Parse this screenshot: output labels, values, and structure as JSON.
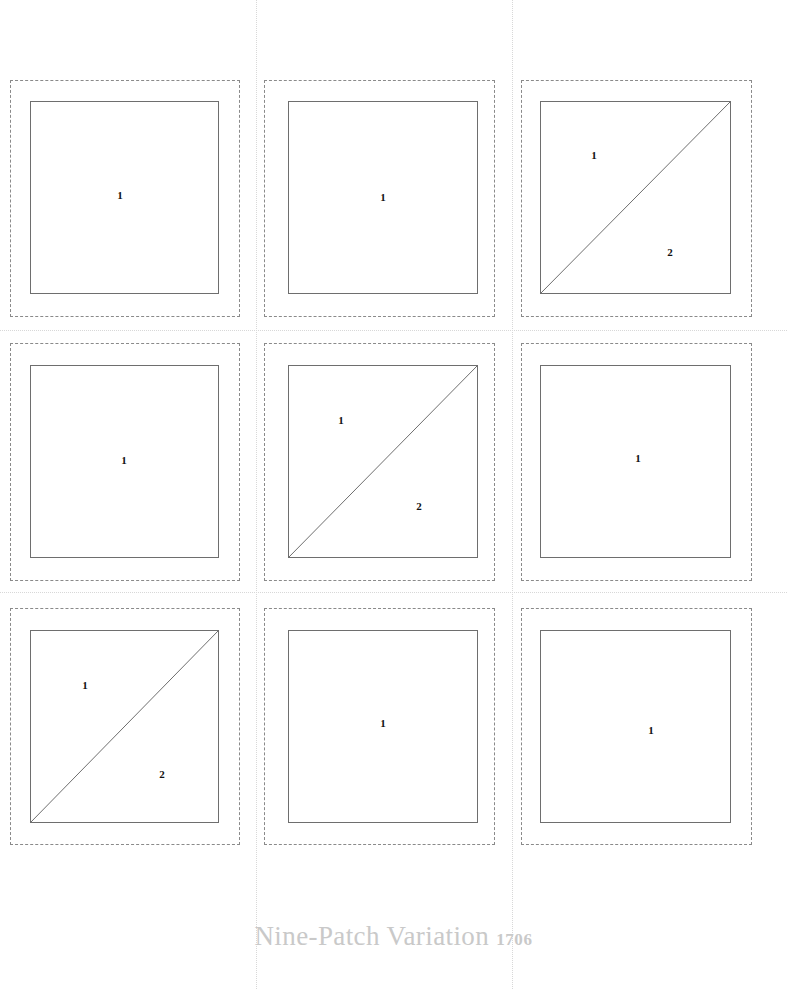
{
  "page": {
    "background_color": "#ffffff",
    "width": 787,
    "height": 989
  },
  "footer": {
    "title": "Nine-Patch Variation",
    "pattern_number": "1706",
    "color": "#c9c9c9"
  },
  "style": {
    "seam_line_color": "#8a8a8a",
    "cut_line_color": "#6e6e6e",
    "guide_line_color": "#d8d8d8",
    "label_color": "#111111"
  },
  "grid": {
    "rows": 3,
    "columns": 3,
    "total_blocks": 9
  },
  "guides": {
    "vertical": [
      {
        "x": 256,
        "y": 0,
        "height": 989
      },
      {
        "x": 512,
        "y": 0,
        "height": 989
      }
    ],
    "horizontal": [
      {
        "y": 330,
        "x": 0,
        "width": 787
      },
      {
        "y": 592,
        "x": 0,
        "width": 787
      }
    ]
  },
  "blocks": [
    {
      "id": "block-r1c1",
      "row": 1,
      "column": 1,
      "shape": "square",
      "seam": {
        "x": 10,
        "y": 80,
        "width": 230,
        "height": 237
      },
      "cut": {
        "x": 20,
        "y": 21,
        "width": 189,
        "height": 193
      },
      "labels": [
        {
          "text": "1",
          "x": 110,
          "y": 115
        }
      ]
    },
    {
      "id": "block-r1c2",
      "row": 1,
      "column": 2,
      "shape": "square",
      "seam": {
        "x": 264,
        "y": 80,
        "width": 231,
        "height": 237
      },
      "cut": {
        "x": 24,
        "y": 21,
        "width": 190,
        "height": 193
      },
      "labels": [
        {
          "text": "1",
          "x": 119,
          "y": 117
        }
      ]
    },
    {
      "id": "block-r1c3",
      "row": 1,
      "column": 3,
      "shape": "half-square-triangle",
      "diagonal_direction": "bottom-left-to-top-right",
      "seam": {
        "x": 521,
        "y": 80,
        "width": 231,
        "height": 237
      },
      "cut": {
        "x": 19,
        "y": 21,
        "width": 191,
        "height": 193
      },
      "labels": [
        {
          "text": "1",
          "x": 73,
          "y": 75
        },
        {
          "text": "2",
          "x": 149,
          "y": 172
        }
      ]
    },
    {
      "id": "block-r2c1",
      "row": 2,
      "column": 1,
      "shape": "square",
      "seam": {
        "x": 10,
        "y": 343,
        "width": 230,
        "height": 238
      },
      "cut": {
        "x": 20,
        "y": 22,
        "width": 189,
        "height": 193
      },
      "labels": [
        {
          "text": "1",
          "x": 114,
          "y": 117
        }
      ]
    },
    {
      "id": "block-r2c2",
      "row": 2,
      "column": 2,
      "shape": "half-square-triangle",
      "diagonal_direction": "bottom-left-to-top-right",
      "seam": {
        "x": 264,
        "y": 343,
        "width": 231,
        "height": 238
      },
      "cut": {
        "x": 24,
        "y": 22,
        "width": 190,
        "height": 193
      },
      "labels": [
        {
          "text": "1",
          "x": 77,
          "y": 77
        },
        {
          "text": "2",
          "x": 155,
          "y": 163
        }
      ]
    },
    {
      "id": "block-r2c3",
      "row": 2,
      "column": 3,
      "shape": "square",
      "seam": {
        "x": 521,
        "y": 343,
        "width": 231,
        "height": 238
      },
      "cut": {
        "x": 19,
        "y": 22,
        "width": 191,
        "height": 193
      },
      "labels": [
        {
          "text": "1",
          "x": 117,
          "y": 115
        }
      ]
    },
    {
      "id": "block-r3c1",
      "row": 3,
      "column": 1,
      "shape": "half-square-triangle",
      "diagonal_direction": "bottom-left-to-top-right",
      "seam": {
        "x": 10,
        "y": 608,
        "width": 230,
        "height": 237
      },
      "cut": {
        "x": 20,
        "y": 22,
        "width": 189,
        "height": 193
      },
      "labels": [
        {
          "text": "1",
          "x": 75,
          "y": 77
        },
        {
          "text": "2",
          "x": 152,
          "y": 166
        }
      ]
    },
    {
      "id": "block-r3c2",
      "row": 3,
      "column": 2,
      "shape": "square",
      "seam": {
        "x": 264,
        "y": 608,
        "width": 231,
        "height": 237
      },
      "cut": {
        "x": 24,
        "y": 22,
        "width": 190,
        "height": 193
      },
      "labels": [
        {
          "text": "1",
          "x": 119,
          "y": 115
        }
      ]
    },
    {
      "id": "block-r3c3",
      "row": 3,
      "column": 3,
      "shape": "square",
      "seam": {
        "x": 521,
        "y": 608,
        "width": 231,
        "height": 237
      },
      "cut": {
        "x": 19,
        "y": 22,
        "width": 191,
        "height": 193
      },
      "labels": [
        {
          "text": "1",
          "x": 130,
          "y": 122
        }
      ]
    }
  ],
  "footer_position": {
    "y": 921
  }
}
